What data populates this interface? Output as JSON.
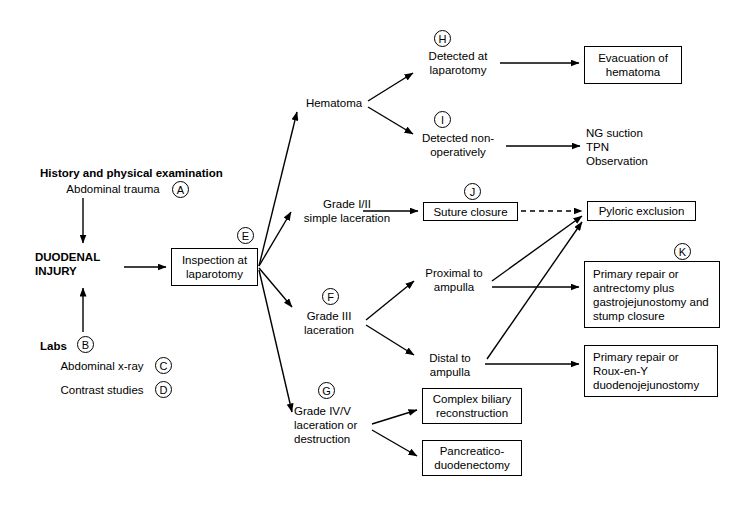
{
  "diagram": {
    "stroke_color": "#000000",
    "background_color": "#ffffff"
  },
  "nodes": [
    {
      "id": "history",
      "text": "History and physical examination",
      "kind": "text-bold",
      "x": 40,
      "y": 166,
      "w": 200,
      "h": 14
    },
    {
      "id": "abd_trauma",
      "text": "Abdominal trauma",
      "kind": "text",
      "x": 58,
      "y": 181,
      "w": 110,
      "h": 15
    },
    {
      "id": "duodenal",
      "text": "DUODENAL\nINJURY",
      "kind": "text-bold",
      "x": 35,
      "y": 249,
      "w": 90,
      "h": 30
    },
    {
      "id": "labs",
      "text": "Labs",
      "kind": "text-bold",
      "x": 40,
      "y": 339,
      "w": 34,
      "h": 14
    },
    {
      "id": "abd_xray",
      "text": "Abdominal x-ray",
      "kind": "text",
      "x": 53,
      "y": 358,
      "w": 98,
      "h": 15
    },
    {
      "id": "contrast",
      "text": "Contrast studies",
      "kind": "text",
      "x": 53,
      "y": 382,
      "w": 98,
      "h": 15
    },
    {
      "id": "inspection",
      "text": "Inspection at\nlaparotomy",
      "kind": "box",
      "x": 171,
      "y": 248,
      "w": 87,
      "h": 38
    },
    {
      "id": "hematoma",
      "text": "Hematoma",
      "kind": "text",
      "x": 303,
      "y": 95,
      "w": 62,
      "h": 15
    },
    {
      "id": "detected_lap",
      "text": "Detected at\nlaparotomy",
      "kind": "text",
      "x": 418,
      "y": 48,
      "w": 80,
      "h": 30
    },
    {
      "id": "detected_nonop",
      "text": "Detected non-\noperatively",
      "kind": "text",
      "x": 412,
      "y": 130,
      "w": 92,
      "h": 30
    },
    {
      "id": "evacuation",
      "text": "Evacuation of\nhematoma",
      "kind": "box",
      "x": 584,
      "y": 46,
      "w": 98,
      "h": 38
    },
    {
      "id": "ng_tpn_obs",
      "text": "NG suction\nTPN\nObservation",
      "kind": "text-left",
      "x": 586,
      "y": 124,
      "w": 110,
      "h": 46
    },
    {
      "id": "grade12",
      "text": "Grade I/II\nsimple laceration",
      "kind": "text",
      "x": 294,
      "y": 196,
      "w": 106,
      "h": 30
    },
    {
      "id": "suture",
      "text": "Suture closure",
      "kind": "box",
      "x": 423,
      "y": 202,
      "w": 95,
      "h": 19
    },
    {
      "id": "pyloric",
      "text": "Pyloric exclusion",
      "kind": "box",
      "x": 587,
      "y": 201,
      "w": 109,
      "h": 20
    },
    {
      "id": "grade3",
      "text": "Grade III\nlaceration",
      "kind": "text",
      "x": 294,
      "y": 308,
      "w": 70,
      "h": 30
    },
    {
      "id": "proximal",
      "text": "Proximal to\nampulla",
      "kind": "text",
      "x": 418,
      "y": 265,
      "w": 72,
      "h": 30
    },
    {
      "id": "distal",
      "text": "Distal to\nampulla",
      "kind": "text",
      "x": 418,
      "y": 350,
      "w": 64,
      "h": 30
    },
    {
      "id": "primary_k",
      "text": "Primary repair or\nantrectomy plus\ngastrojejunostomy and\nstump closure",
      "kind": "box-left",
      "x": 584,
      "y": 261,
      "w": 136,
      "h": 67
    },
    {
      "id": "roux",
      "text": "Primary repair or\nRoux-en-Y\n   duodenojejunostomy",
      "kind": "box-left",
      "x": 584,
      "y": 345,
      "w": 134,
      "h": 52
    },
    {
      "id": "grade45",
      "text": "Grade IV/V\nlaceration or\ndestruction",
      "kind": "text-left",
      "x": 294,
      "y": 402,
      "w": 82,
      "h": 45
    },
    {
      "id": "biliary",
      "text": "Complex biliary\nreconstruction",
      "kind": "box",
      "x": 422,
      "y": 388,
      "w": 100,
      "h": 36
    },
    {
      "id": "pancreatico",
      "text": "Pancreatico-\nduodenectomy",
      "kind": "box",
      "x": 422,
      "y": 440,
      "w": 100,
      "h": 36
    }
  ],
  "circle_labels": [
    {
      "id": "A",
      "letter": "A",
      "x": 172,
      "y": 181
    },
    {
      "id": "B",
      "letter": "B",
      "x": 77,
      "y": 336
    },
    {
      "id": "C",
      "letter": "C",
      "x": 155,
      "y": 357
    },
    {
      "id": "D",
      "letter": "D",
      "x": 155,
      "y": 381
    },
    {
      "id": "E",
      "letter": "E",
      "x": 237,
      "y": 227
    },
    {
      "id": "F",
      "letter": "F",
      "x": 322,
      "y": 288
    },
    {
      "id": "G",
      "letter": "G",
      "x": 318,
      "y": 382
    },
    {
      "id": "H",
      "letter": "H",
      "x": 434,
      "y": 30
    },
    {
      "id": "I",
      "letter": "I",
      "x": 434,
      "y": 111
    },
    {
      "id": "J",
      "letter": "J",
      "x": 464,
      "y": 183
    },
    {
      "id": "K",
      "letter": "K",
      "x": 674,
      "y": 243
    }
  ],
  "edges": [
    {
      "id": "e-trauma-duodenal",
      "from": "abd_trauma",
      "to": "duodenal",
      "style": "solid",
      "arrow": true,
      "d": "M 83 198 L 83 243"
    },
    {
      "id": "e-labs-duodenal",
      "from": "labs",
      "to": "duodenal",
      "style": "solid",
      "arrow": true,
      "d": "M 83 332 L 83 288"
    },
    {
      "id": "e-duodenal-insp",
      "from": "duodenal",
      "to": "inspection",
      "style": "solid",
      "arrow": true,
      "d": "M 124 267 L 166 267"
    },
    {
      "id": "e-insp-hematoma",
      "from": "inspection",
      "to": "hematoma",
      "style": "solid",
      "arrow": true,
      "d": "M 259 266 L 297 112"
    },
    {
      "id": "e-insp-grade12",
      "from": "inspection",
      "to": "grade12",
      "style": "solid",
      "arrow": true,
      "d": "M 259 266 L 291 212"
    },
    {
      "id": "e-insp-grade3",
      "from": "inspection",
      "to": "grade3",
      "style": "solid",
      "arrow": true,
      "d": "M 259 268 L 292 307"
    },
    {
      "id": "e-insp-grade45",
      "from": "inspection",
      "to": "grade45",
      "style": "solid",
      "arrow": true,
      "d": "M 259 270 L 292 412"
    },
    {
      "id": "e-hema-detlap",
      "from": "hematoma",
      "to": "detected_lap",
      "style": "solid",
      "arrow": true,
      "d": "M 368 101 L 413 73"
    },
    {
      "id": "e-hema-detnonop",
      "from": "hematoma",
      "to": "detected_nonop",
      "style": "solid",
      "arrow": true,
      "d": "M 368 107 L 413 134"
    },
    {
      "id": "e-detlap-evac",
      "from": "detected_lap",
      "to": "evacuation",
      "style": "solid",
      "arrow": true,
      "d": "M 500 63 L 579 63"
    },
    {
      "id": "e-detnonop-ng",
      "from": "detected_nonop",
      "to": "ng_tpn_obs",
      "style": "solid",
      "arrow": true,
      "d": "M 506 146 L 580 146"
    },
    {
      "id": "e-grade12-suture",
      "from": "grade12",
      "to": "suture",
      "style": "solid",
      "arrow": true,
      "d": "M 363 211 L 418 211"
    },
    {
      "id": "e-suture-pyloric",
      "from": "suture",
      "to": "pyloric",
      "style": "dashed",
      "arrow": true,
      "d": "M 521 211 L 582 211"
    },
    {
      "id": "e-grade3-prox",
      "from": "grade3",
      "to": "proximal",
      "style": "solid",
      "arrow": true,
      "d": "M 366 320 L 414 281"
    },
    {
      "id": "e-grade3-distal",
      "from": "grade3",
      "to": "distal",
      "style": "solid",
      "arrow": true,
      "d": "M 366 325 L 414 355"
    },
    {
      "id": "e-prox-pyloric",
      "from": "proximal",
      "to": "pyloric",
      "style": "solid",
      "arrow": true,
      "d": "M 492 281 L 582 216"
    },
    {
      "id": "e-prox-k",
      "from": "proximal",
      "to": "primary_k",
      "style": "solid",
      "arrow": true,
      "d": "M 492 287 L 579 287"
    },
    {
      "id": "e-distal-pyloric",
      "from": "distal",
      "to": "pyloric",
      "style": "solid",
      "arrow": true,
      "d": "M 487 359 L 582 222"
    },
    {
      "id": "e-distal-roux",
      "from": "distal",
      "to": "roux",
      "style": "solid",
      "arrow": true,
      "d": "M 485 364 L 579 364"
    },
    {
      "id": "e-grade45-biliary",
      "from": "grade45",
      "to": "biliary",
      "style": "solid",
      "arrow": true,
      "d": "M 372 424 L 417 410"
    },
    {
      "id": "e-grade45-panc",
      "from": "grade45",
      "to": "pancreatico",
      "style": "solid",
      "arrow": true,
      "d": "M 372 430 L 417 456"
    }
  ]
}
